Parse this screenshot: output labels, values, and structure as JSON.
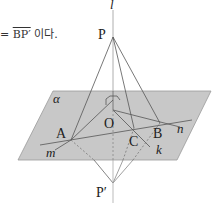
{
  "caption": {
    "prefix": "= ",
    "segment": "BP′",
    "suffix": " 이다."
  },
  "diagram": {
    "plane_label": "α",
    "line_labels": {
      "l": "l",
      "m": "m",
      "n": "n",
      "k": "k"
    },
    "point_labels": {
      "P": "P",
      "P_prime": "P′",
      "O": "O",
      "A": "A",
      "B": "B",
      "C": "C"
    },
    "colors": {
      "plane_fill": "#c8c8c8",
      "plane_edge": "#9a9a9a",
      "line": "#555555",
      "dashed": "#777777"
    }
  }
}
